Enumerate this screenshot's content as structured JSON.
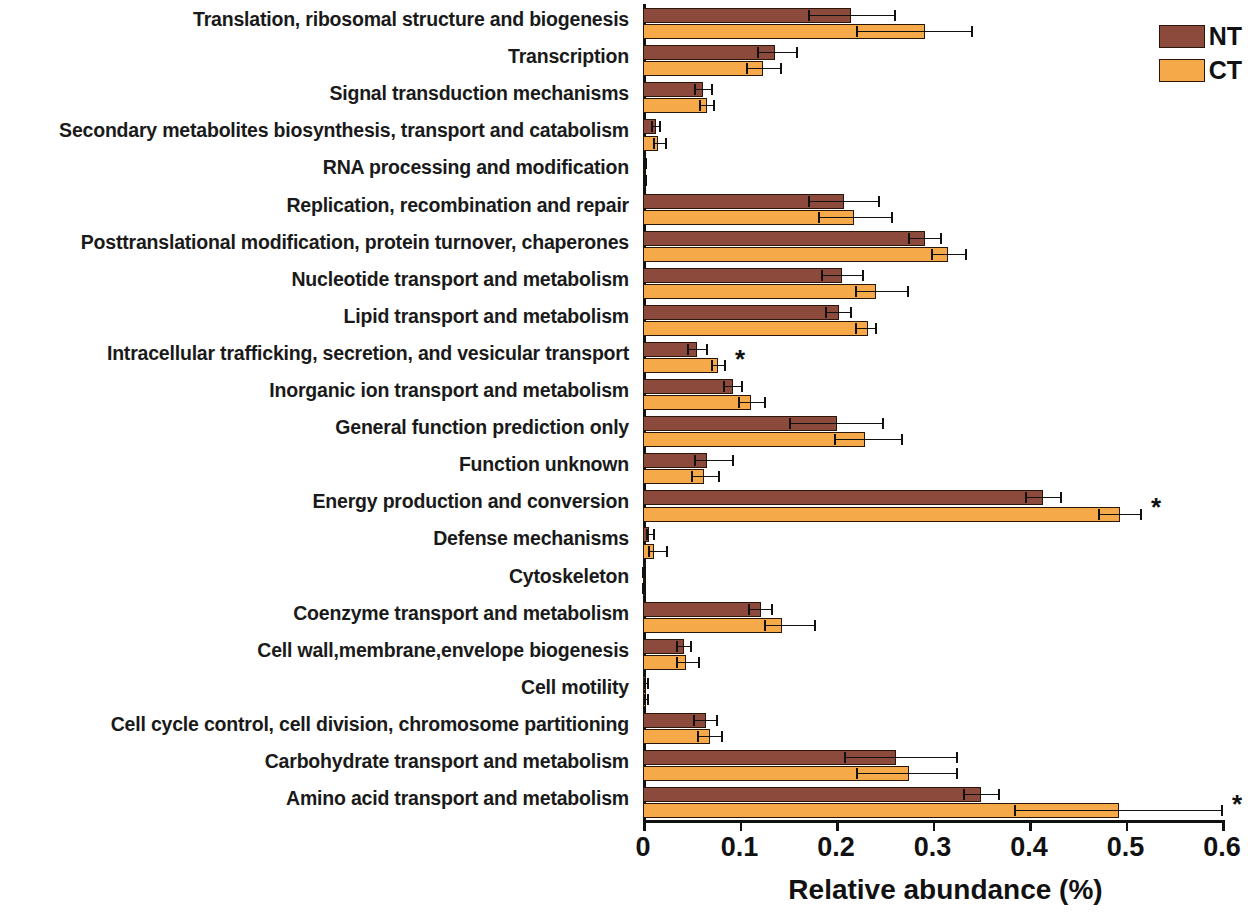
{
  "chart": {
    "type": "bar",
    "orientation": "horizontal",
    "xlabel": "Relative abundance (%)",
    "ylabel": "",
    "title": "",
    "xlim": [
      0,
      0.6
    ],
    "xticks": [
      "0",
      "0.1",
      "0.2",
      "0.3",
      "0.4",
      "0.5",
      "0.6"
    ],
    "grid": false,
    "legend_position": "top-right",
    "colors": {
      "NT": "#8c4a3c",
      "CT": "#f5a949",
      "axis": "#111111",
      "bar_outline": "#2a1608"
    },
    "significance_marker": "*"
  },
  "legend": {
    "items": [
      {
        "key": "NT",
        "label": "NT",
        "color": "#8c4a3c"
      },
      {
        "key": "CT",
        "label": "CT",
        "color": "#f5a949"
      }
    ]
  },
  "chart_data": {
    "type": "bar",
    "title": "",
    "xlabel": "Relative abundance (%)",
    "ylabel": "",
    "xlim": [
      0,
      0.6
    ],
    "xticks": [
      0,
      0.1,
      0.2,
      0.3,
      0.4,
      0.5,
      0.6
    ],
    "grid": false,
    "legend": [
      "NT",
      "CT"
    ],
    "legend_position": "top-right",
    "orientation": "horizontal",
    "categories": [
      "Translation, ribosomal structure and biogenesis",
      "Transcription",
      "Signal transduction mechanisms",
      "Secondary metabolites biosynthesis, transport and catabolism",
      "RNA processing and modification",
      "Replication, recombination and repair",
      "Posttranslational modification, protein turnover, chaperones",
      "Nucleotide transport and metabolism",
      "Lipid transport and metabolism",
      "Intracellular trafficking, secretion, and vesicular transport",
      "Inorganic ion transport and metabolism",
      "General function prediction only",
      "Function unknown",
      "Energy production and conversion",
      "Defense mechanisms",
      "Cytoskeleton",
      "Coenzyme transport and metabolism",
      "Cell wall,membrane,envelope biogenesis",
      "Cell motility",
      "Cell cycle control, cell division, chromosome partitioning",
      "Carbohydrate transport and metabolism",
      "Amino acid transport and metabolism"
    ],
    "series": [
      {
        "name": "NT",
        "color": "#8c4a3c",
        "values": [
          0.216,
          0.137,
          0.062,
          0.013,
          0.002,
          0.208,
          0.292,
          0.206,
          0.203,
          0.056,
          0.093,
          0.201,
          0.066,
          0.414,
          0.006,
          0.001,
          0.122,
          0.042,
          0.003,
          0.065,
          0.262,
          0.35
        ],
        "err_low": [
          0.172,
          0.119,
          0.054,
          0.009,
          0.001,
          0.172,
          0.276,
          0.186,
          0.19,
          0.047,
          0.084,
          0.152,
          0.054,
          0.397,
          0.004,
          0.0,
          0.11,
          0.035,
          0.002,
          0.053,
          0.209,
          0.333
        ],
        "err_high": [
          0.261,
          0.16,
          0.072,
          0.018,
          0.003,
          0.245,
          0.309,
          0.228,
          0.216,
          0.066,
          0.103,
          0.249,
          0.093,
          0.433,
          0.011,
          0.002,
          0.134,
          0.05,
          0.005,
          0.077,
          0.325,
          0.369
        ]
      },
      {
        "name": "CT",
        "color": "#f5a949",
        "values": [
          0.292,
          0.124,
          0.066,
          0.016,
          0.002,
          0.219,
          0.316,
          0.241,
          0.233,
          0.078,
          0.112,
          0.23,
          0.063,
          0.494,
          0.011,
          0.001,
          0.144,
          0.045,
          0.003,
          0.069,
          0.276,
          0.493
        ],
        "err_low": [
          0.222,
          0.108,
          0.059,
          0.011,
          0.001,
          0.182,
          0.299,
          0.221,
          0.221,
          0.071,
          0.099,
          0.199,
          0.051,
          0.473,
          0.006,
          0.0,
          0.126,
          0.035,
          0.002,
          0.057,
          0.222,
          0.385
        ],
        "err_high": [
          0.341,
          0.143,
          0.074,
          0.024,
          0.003,
          0.258,
          0.335,
          0.275,
          0.241,
          0.085,
          0.126,
          0.268,
          0.079,
          0.516,
          0.025,
          0.002,
          0.178,
          0.058,
          0.005,
          0.082,
          0.325,
          0.6
        ]
      }
    ],
    "significant_categories": [
      "Intracellular trafficking, secretion, and vesicular transport",
      "Energy production and conversion",
      "Amino acid transport and metabolism"
    ]
  }
}
